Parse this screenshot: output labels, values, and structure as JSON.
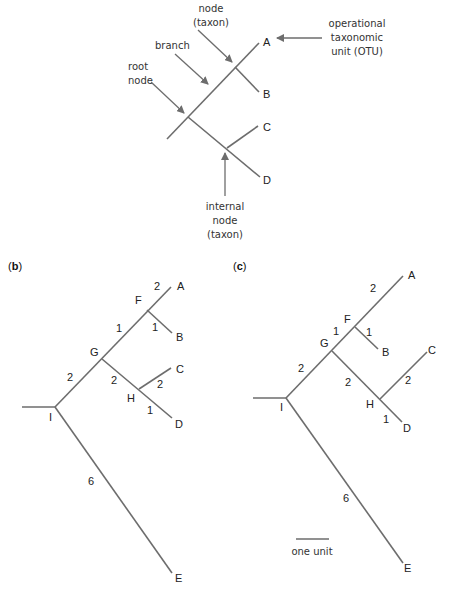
{
  "panel_a": {
    "tips": {
      "A": "A",
      "B": "B",
      "C": "C",
      "D": "D"
    },
    "annotations": {
      "internal_node_top": [
        "internal",
        "node",
        "(taxon)"
      ],
      "branch": "branch",
      "root_node": [
        "root",
        "node"
      ],
      "otu": [
        "operational",
        "taxonomic",
        "unit (OTU)"
      ],
      "internal_node_bottom": [
        "internal",
        "node",
        "(taxon)"
      ]
    }
  },
  "panel_b": {
    "label": "b",
    "nodes": {
      "A": "A",
      "B": "B",
      "C": "C",
      "D": "D",
      "E": "E",
      "F": "F",
      "G": "G",
      "H": "H",
      "I": "I"
    },
    "branch_lengths": {
      "F_A": "2",
      "F_B": "1",
      "G_F": "1",
      "I_G": "2",
      "G_H": "2",
      "H_C": "2",
      "H_D": "1",
      "I_E": "6"
    }
  },
  "panel_c": {
    "label": "c",
    "nodes": {
      "A": "A",
      "B": "B",
      "C": "C",
      "D": "D",
      "E": "E",
      "F": "F",
      "G": "G",
      "H": "H",
      "I": "I"
    },
    "branch_lengths": {
      "F_A": "2",
      "F_B": "1",
      "G_F": "1",
      "I_G": "2",
      "G_H": "2",
      "H_C": "2",
      "H_D": "1",
      "I_E": "6"
    },
    "scale_bar": "one unit"
  }
}
